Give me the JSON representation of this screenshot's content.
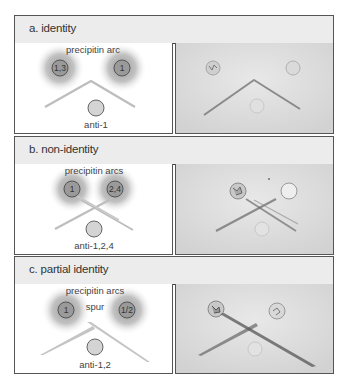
{
  "figure": {
    "panels": [
      {
        "id": "a",
        "header": "a. identity",
        "arc_label": "precipitin arc",
        "well_left": "1,3",
        "well_right": "1",
        "antibody_label": "anti-1",
        "pattern": "identity"
      },
      {
        "id": "b",
        "header": "b. non-identity",
        "arc_label": "precipitin arcs",
        "well_left": "1",
        "well_right": "2,4",
        "antibody_label": "anti-1,2,4",
        "pattern": "non-identity"
      },
      {
        "id": "c",
        "header": "c. partial identity",
        "arc_label": "precipitin arcs",
        "spur_label": "spur",
        "well_left": "1",
        "well_right": "1/2",
        "antibody_label": "anti-1,2",
        "pattern": "partial-identity"
      }
    ],
    "colors": {
      "header_bg": "#ececec",
      "border": "#555555",
      "well_fill": "#9a9a9a",
      "antibody_well_fill": "#d4d4d4",
      "halo": "#9c9c9c",
      "arc": "#b8b8b8",
      "photo_bg": "#dedede"
    }
  }
}
